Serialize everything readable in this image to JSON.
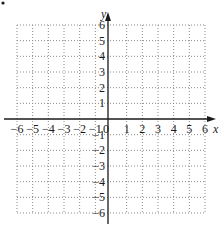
{
  "figure": {
    "marker": "•"
  },
  "chart_data": {
    "type": "scatter",
    "title": "",
    "xlabel": "x",
    "ylabel": "y",
    "xlim": [
      -6,
      6
    ],
    "ylim": [
      -6,
      6
    ],
    "grid": true,
    "grid_style": "dotted",
    "x_ticks": [
      "-6",
      "-5",
      "-4",
      "-3",
      "-2",
      "-1",
      "0",
      "1",
      "2",
      "3",
      "4",
      "5",
      "6"
    ],
    "y_ticks_positive": [
      "1",
      "2",
      "3",
      "4",
      "5",
      "6"
    ],
    "y_ticks_negative": [
      "-1",
      "-2",
      "-3",
      "-4",
      "-5",
      "-6"
    ],
    "series": [],
    "colors": {
      "axis": "#1a1a1a",
      "grid": "#8a8a8a",
      "background": "#ffffff"
    }
  }
}
